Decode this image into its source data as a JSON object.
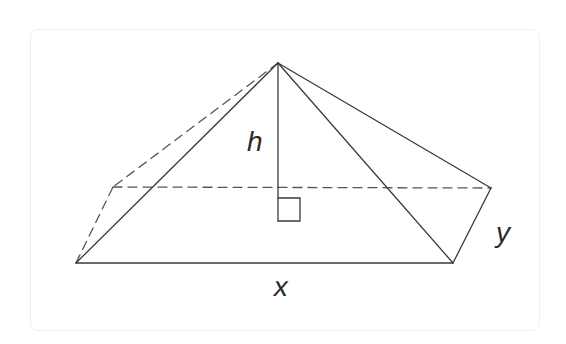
{
  "diagram": {
    "type": "geometry",
    "labels": {
      "height": "h",
      "base_length": "x",
      "base_width": "y"
    },
    "colors": {
      "stroke": "#3a3a3a",
      "dashed_stroke": "#555555",
      "frame": "#efefef",
      "background": "#ffffff"
    },
    "vertices": {
      "apex": [
        278,
        63
      ],
      "front_left": [
        76,
        263
      ],
      "front_right": [
        453,
        263
      ],
      "back_left": [
        113,
        187
      ],
      "back_right": [
        491,
        188
      ],
      "height_foot": [
        278,
        221
      ]
    },
    "edges": {
      "solid": [
        [
          "apex",
          "front_left"
        ],
        [
          "apex",
          "front_right"
        ],
        [
          "apex",
          "back_right"
        ],
        [
          "front_left",
          "front_right"
        ],
        [
          "front_right",
          "back_right"
        ]
      ],
      "dashed": [
        [
          "apex",
          "back_left"
        ],
        [
          "front_left",
          "back_left"
        ],
        [
          "back_left",
          "back_right"
        ]
      ],
      "height_line": [
        "apex",
        "height_foot"
      ]
    },
    "right_angle_marker": true
  }
}
